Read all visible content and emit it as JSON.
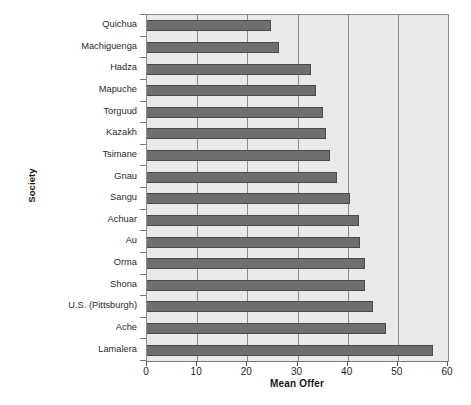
{
  "chart_data": {
    "type": "bar",
    "orientation": "horizontal",
    "title": "",
    "xlabel": "Mean Offer",
    "ylabel": "Society",
    "xlim": [
      0,
      60
    ],
    "ylim": null,
    "xticks": [
      0,
      10,
      20,
      30,
      40,
      50,
      60
    ],
    "xtick_labels": [
      "0",
      "10",
      "20",
      "30",
      "40",
      "50",
      "60"
    ],
    "grid": "vertical",
    "legend": null,
    "bar_color": "#6e6e6e",
    "plot_background": "#e9e9e9",
    "categories": [
      "Quichua",
      "Machiguenga",
      "Hadza",
      "Mapuche",
      "Torguud",
      "Kazakh",
      "Tsimane",
      "Gnau",
      "Sangu",
      "Achuar",
      "Au",
      "Orma",
      "Shona",
      "U.S. (Pittsburgh)",
      "Ache",
      "Lamalera"
    ],
    "values": [
      24.8,
      26.3,
      32.7,
      33.7,
      35.0,
      35.6,
      36.4,
      37.8,
      40.5,
      42.3,
      42.4,
      43.4,
      43.5,
      45.0,
      47.6,
      57.0
    ]
  },
  "caption": ""
}
